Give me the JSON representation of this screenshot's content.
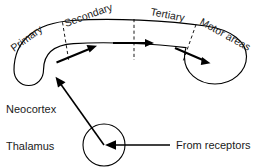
{
  "figure": {
    "title_visible": false,
    "background_color": "#ffffff",
    "ink_color": "#000000"
  },
  "labels": {
    "primary": "Primary",
    "secondary": "Secondary",
    "tertiary": "Tertiary",
    "motor_areas": "Motor areas",
    "neocortex": "Neocortex",
    "thalamus": "Thalamus",
    "from_receptors": "From receptors"
  },
  "regions": [
    {
      "id": "primary",
      "label": "Primary",
      "order": 1
    },
    {
      "id": "secondary",
      "label": "Secondary",
      "order": 2
    },
    {
      "id": "tertiary",
      "label": "Tertiary",
      "order": 3
    },
    {
      "id": "motor-areas",
      "label": "Motor areas",
      "order": 4
    }
  ],
  "structures": [
    {
      "id": "neocortex",
      "label": "Neocortex",
      "shape": "curved-band"
    },
    {
      "id": "thalamus",
      "label": "Thalamus",
      "shape": "circle"
    }
  ],
  "connections": [
    {
      "id": "receptors-to-thalamus",
      "label": "From receptors",
      "from": "receptors",
      "to": "thalamus",
      "arrow": "left"
    },
    {
      "id": "thalamus-to-neocortex",
      "label": "",
      "from": "thalamus",
      "to": "neocortex",
      "arrow": "up-left"
    },
    {
      "id": "primary-to-secondary",
      "label": "",
      "from": "primary",
      "to": "secondary",
      "arrow": "right"
    },
    {
      "id": "secondary-to-tertiary",
      "label": "",
      "from": "secondary",
      "to": "tertiary",
      "arrow": "right"
    },
    {
      "id": "tertiary-to-motor",
      "label": "",
      "from": "tertiary",
      "to": "motor-areas",
      "arrow": "right-down"
    }
  ],
  "icons": {
    "arrowhead": "arrowhead-icon",
    "dashed_divider": "dashed-divider-icon"
  }
}
